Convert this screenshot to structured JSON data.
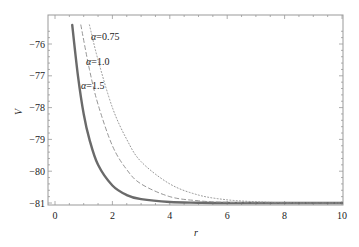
{
  "chart_data": {
    "type": "line",
    "title": "",
    "xlabel": "r",
    "ylabel": "V",
    "xlim": [
      0,
      10
    ],
    "ylim": [
      -81.1,
      -75.4
    ],
    "xticks": [
      0,
      2,
      4,
      6,
      8,
      10
    ],
    "xtick_labels": [
      "0",
      "2",
      "4",
      "6",
      "8",
      "10"
    ],
    "yticks": [
      -76,
      -77,
      -78,
      -79,
      -80,
      -81
    ],
    "ytick_labels": [
      "-76",
      "-77",
      "-78",
      "-79",
      "-80",
      "-81"
    ],
    "grid": false,
    "legend": "inline annotations",
    "series": [
      {
        "name": "α=1.5",
        "style": "solid-thick",
        "color": "#666666",
        "x": [
          0.6,
          0.8,
          1.0,
          1.2,
          1.5,
          2.0,
          2.5,
          3.0,
          4.0,
          5.0,
          6.0,
          8.0,
          10.0
        ],
        "y": [
          -75.4,
          -77.0,
          -78.2,
          -79.0,
          -79.8,
          -80.45,
          -80.75,
          -80.88,
          -80.97,
          -80.99,
          -81.0,
          -81.0,
          -81.0
        ]
      },
      {
        "name": "α=1.0",
        "style": "dashed",
        "color": "#888888",
        "x": [
          0.9,
          1.2,
          1.5,
          2.0,
          2.5,
          3.0,
          4.0,
          5.0,
          6.0,
          8.0,
          10.0
        ],
        "y": [
          -75.4,
          -76.8,
          -77.9,
          -79.2,
          -79.95,
          -80.4,
          -80.8,
          -80.93,
          -80.98,
          -81.0,
          -81.0
        ]
      },
      {
        "name": "α=0.75",
        "style": "dotted",
        "color": "#888888",
        "x": [
          1.2,
          1.5,
          2.0,
          2.5,
          3.0,
          4.0,
          5.0,
          6.0,
          7.0,
          8.0,
          10.0
        ],
        "y": [
          -75.4,
          -76.5,
          -78.0,
          -79.0,
          -79.7,
          -80.4,
          -80.75,
          -80.9,
          -80.96,
          -80.99,
          -81.0
        ]
      }
    ],
    "annotations": [
      {
        "text": "α=0.75",
        "x": 1.3,
        "y": -75.8
      },
      {
        "text": "α=1.0",
        "x": 1.1,
        "y": -76.6
      },
      {
        "text": "α=1.5",
        "x": 0.9,
        "y": -77.4
      }
    ]
  }
}
